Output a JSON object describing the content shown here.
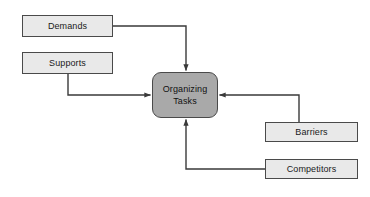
{
  "diagram": {
    "canvas": {
      "width": 370,
      "height": 197,
      "background": "#ffffff"
    },
    "style": {
      "box_fill": "#e9e9e9",
      "center_fill": "#a9a9a9",
      "border_color": "#4a4a4a",
      "line_color": "#3a3a3a",
      "text_color": "#1a1a1a"
    },
    "center_node": {
      "id": "organizing-tasks",
      "line1": "Organizing",
      "line2": "Tasks",
      "shape": "rounded-rectangle",
      "x": 152,
      "y": 72,
      "width": 66,
      "height": 46
    },
    "nodes": [
      {
        "id": "demands",
        "label": "Demands",
        "x": 22,
        "y": 15,
        "width": 91,
        "height": 22
      },
      {
        "id": "supports",
        "label": "Supports",
        "x": 22,
        "y": 52,
        "width": 91,
        "height": 22
      },
      {
        "id": "barriers",
        "label": "Barriers",
        "x": 265,
        "y": 122,
        "width": 93,
        "height": 20
      },
      {
        "id": "competitors",
        "label": "Competitors",
        "x": 265,
        "y": 159,
        "width": 93,
        "height": 20
      }
    ],
    "edges": [
      {
        "id": "demands-to-center",
        "from": "demands",
        "to": "organizing-tasks",
        "enters": "top",
        "arrow": true
      },
      {
        "id": "supports-to-center",
        "from": "supports",
        "to": "organizing-tasks",
        "enters": "left",
        "arrow": true
      },
      {
        "id": "barriers-to-center",
        "from": "barriers",
        "to": "organizing-tasks",
        "enters": "right",
        "arrow": true
      },
      {
        "id": "competitors-to-center",
        "from": "competitors",
        "to": "organizing-tasks",
        "enters": "bottom",
        "arrow": true
      }
    ]
  }
}
